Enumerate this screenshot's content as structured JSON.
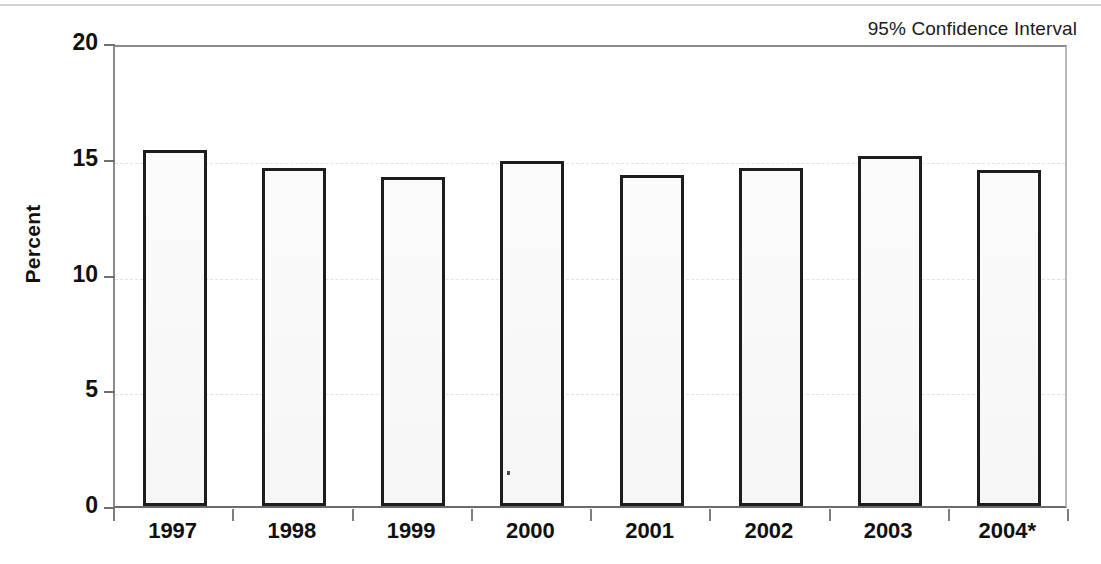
{
  "figure": {
    "width": 1101,
    "height": 564,
    "background": "#ffffff",
    "top_rule_color": "#d2d2d4"
  },
  "annotation": {
    "confidence_note": "95% Confidence Interval"
  },
  "axis": {
    "y_title": "Percent",
    "y_ticks": [
      "0",
      "5",
      "10",
      "15",
      "20"
    ],
    "x_ticks": [
      "1997",
      "1998",
      "1999",
      "2000",
      "2001",
      "2002",
      "2003",
      "2004*"
    ]
  },
  "style": {
    "bar_outline": "#1d1d1d",
    "bar_fill": "#f8f8f8",
    "gridline": "#e2e2e4",
    "axis_line": "#6a6a6c",
    "text": "#101010"
  },
  "chart_data": {
    "type": "bar",
    "title": "",
    "subtitle": "",
    "xlabel": "",
    "ylabel": "Percent",
    "ylim": [
      0,
      20
    ],
    "yticks": [
      0,
      5,
      10,
      15,
      20
    ],
    "grid": true,
    "legend": "95% Confidence Interval",
    "legend_position": "top-right",
    "categories": [
      "1997",
      "1998",
      "1999",
      "2000",
      "2001",
      "2002",
      "2003",
      "2004*"
    ],
    "values": [
      15.4,
      14.6,
      14.2,
      14.9,
      14.3,
      14.6,
      15.1,
      14.5
    ],
    "series": [
      {
        "name": "Percent",
        "values": [
          15.4,
          14.6,
          14.2,
          14.9,
          14.3,
          14.6,
          15.1,
          14.5
        ]
      }
    ],
    "annotations": [
      "95% Confidence Interval"
    ],
    "notes": [
      "* indicates preliminary or partial-year data for 2004"
    ]
  }
}
